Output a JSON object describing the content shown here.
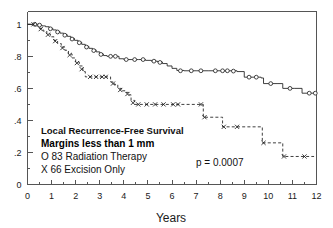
{
  "chart_data": {
    "type": "line",
    "title": "",
    "xlabel": "Years",
    "ylabel": "",
    "xlim": [
      0,
      12
    ],
    "ylim": [
      0,
      1.08
    ],
    "grid": false,
    "legend_position": "inside-lower-left",
    "x_ticks": [
      "0",
      "1",
      "2",
      "3",
      "4",
      "5",
      "6",
      "7",
      "8",
      "9",
      "10",
      "11",
      "12"
    ],
    "y_ticks": [
      "0",
      ".2",
      ".4",
      ".6",
      ".8",
      "1"
    ],
    "y_tick_values": [
      0,
      0.2,
      0.4,
      0.6,
      0.8,
      1.0
    ],
    "x_tick_values": [
      0,
      1,
      2,
      3,
      4,
      5,
      6,
      7,
      8,
      9,
      10,
      11,
      12
    ],
    "annotations": {
      "line1": "Local Recurrence-Free Survival",
      "line2": "Margins less than 1 mm",
      "legend_o": "O  83 Radiation Therapy",
      "legend_x": "X  66 Excision Only",
      "pvalue": "p = 0.0007"
    },
    "series": [
      {
        "name": "Radiation Therapy",
        "n": 83,
        "marker": "o",
        "linestyle": "solid",
        "points": [
          [
            0.0,
            1.0
          ],
          [
            0.25,
            1.0
          ],
          [
            0.45,
            0.995
          ],
          [
            0.6,
            0.99
          ],
          [
            0.75,
            0.985
          ],
          [
            0.9,
            0.975
          ],
          [
            1.05,
            0.965
          ],
          [
            1.2,
            0.955
          ],
          [
            1.35,
            0.945
          ],
          [
            1.5,
            0.935
          ],
          [
            1.65,
            0.925
          ],
          [
            1.8,
            0.912
          ],
          [
            1.95,
            0.9
          ],
          [
            2.1,
            0.888
          ],
          [
            2.25,
            0.875
          ],
          [
            2.4,
            0.862
          ],
          [
            2.55,
            0.85
          ],
          [
            2.7,
            0.84
          ],
          [
            2.85,
            0.828
          ],
          [
            3.0,
            0.815
          ],
          [
            3.15,
            0.805
          ],
          [
            3.3,
            0.8
          ],
          [
            3.55,
            0.8
          ],
          [
            3.8,
            0.785
          ],
          [
            4.0,
            0.78
          ],
          [
            4.3,
            0.78
          ],
          [
            4.6,
            0.78
          ],
          [
            4.9,
            0.775
          ],
          [
            5.15,
            0.77
          ],
          [
            5.4,
            0.765
          ],
          [
            5.6,
            0.755
          ],
          [
            5.8,
            0.74
          ],
          [
            6.0,
            0.725
          ],
          [
            6.2,
            0.712
          ],
          [
            6.5,
            0.71
          ],
          [
            7.0,
            0.71
          ],
          [
            7.5,
            0.71
          ],
          [
            8.0,
            0.71
          ],
          [
            8.4,
            0.71
          ],
          [
            8.7,
            0.705
          ],
          [
            9.0,
            0.67
          ],
          [
            9.4,
            0.67
          ],
          [
            9.7,
            0.665
          ],
          [
            9.8,
            0.63
          ],
          [
            10.4,
            0.63
          ],
          [
            10.6,
            0.6
          ],
          [
            11.1,
            0.6
          ],
          [
            11.4,
            0.57
          ],
          [
            12.0,
            0.57
          ]
        ],
        "censor_marks": [
          [
            0.3,
            1.0
          ],
          [
            0.5,
            0.995
          ],
          [
            0.95,
            0.972
          ],
          [
            1.25,
            0.952
          ],
          [
            1.55,
            0.932
          ],
          [
            1.85,
            0.908
          ],
          [
            2.15,
            0.885
          ],
          [
            2.45,
            0.858
          ],
          [
            2.75,
            0.836
          ],
          [
            3.05,
            0.812
          ],
          [
            3.45,
            0.8
          ],
          [
            3.65,
            0.8
          ],
          [
            4.1,
            0.78
          ],
          [
            4.45,
            0.78
          ],
          [
            4.8,
            0.78
          ],
          [
            5.25,
            0.77
          ],
          [
            5.5,
            0.762
          ],
          [
            6.35,
            0.71
          ],
          [
            6.8,
            0.71
          ],
          [
            7.2,
            0.71
          ],
          [
            7.8,
            0.71
          ],
          [
            8.1,
            0.71
          ],
          [
            8.3,
            0.71
          ],
          [
            8.55,
            0.708
          ],
          [
            9.2,
            0.67
          ],
          [
            9.5,
            0.67
          ],
          [
            10.1,
            0.63
          ],
          [
            10.9,
            0.6
          ],
          [
            11.7,
            0.57
          ],
          [
            11.95,
            0.57
          ]
        ]
      },
      {
        "name": "Excision Only",
        "n": 66,
        "marker": "x",
        "linestyle": "dashed",
        "points": [
          [
            0.0,
            1.0
          ],
          [
            0.2,
            1.0
          ],
          [
            0.35,
            0.99
          ],
          [
            0.5,
            0.975
          ],
          [
            0.65,
            0.958
          ],
          [
            0.8,
            0.94
          ],
          [
            0.95,
            0.922
          ],
          [
            1.1,
            0.9
          ],
          [
            1.25,
            0.88
          ],
          [
            1.4,
            0.858
          ],
          [
            1.55,
            0.838
          ],
          [
            1.7,
            0.815
          ],
          [
            1.85,
            0.79
          ],
          [
            2.0,
            0.765
          ],
          [
            2.15,
            0.74
          ],
          [
            2.3,
            0.705
          ],
          [
            2.4,
            0.672
          ],
          [
            2.7,
            0.672
          ],
          [
            3.0,
            0.672
          ],
          [
            3.3,
            0.672
          ],
          [
            3.45,
            0.64
          ],
          [
            3.6,
            0.625
          ],
          [
            3.75,
            0.6
          ],
          [
            3.9,
            0.585
          ],
          [
            4.05,
            0.575
          ],
          [
            4.2,
            0.56
          ],
          [
            4.3,
            0.525
          ],
          [
            4.45,
            0.5
          ],
          [
            5.0,
            0.5
          ],
          [
            5.5,
            0.5
          ],
          [
            6.0,
            0.5
          ],
          [
            6.3,
            0.5
          ],
          [
            7.25,
            0.5
          ],
          [
            7.3,
            0.42
          ],
          [
            8.05,
            0.42
          ],
          [
            8.1,
            0.36
          ],
          [
            9.7,
            0.36
          ],
          [
            9.75,
            0.26
          ],
          [
            10.55,
            0.26
          ],
          [
            10.6,
            0.175
          ],
          [
            11.9,
            0.175
          ]
        ],
        "censor_marks": [
          [
            0.25,
            1.0
          ],
          [
            0.55,
            0.97
          ],
          [
            0.85,
            0.935
          ],
          [
            1.15,
            0.895
          ],
          [
            1.45,
            0.852
          ],
          [
            1.75,
            0.808
          ],
          [
            2.05,
            0.758
          ],
          [
            2.25,
            0.72
          ],
          [
            2.6,
            0.672
          ],
          [
            2.85,
            0.672
          ],
          [
            3.1,
            0.672
          ],
          [
            3.25,
            0.672
          ],
          [
            3.55,
            0.63
          ],
          [
            3.85,
            0.59
          ],
          [
            4.15,
            0.565
          ],
          [
            4.38,
            0.51
          ],
          [
            4.6,
            0.5
          ],
          [
            4.95,
            0.5
          ],
          [
            5.3,
            0.5
          ],
          [
            5.65,
            0.5
          ],
          [
            6.05,
            0.5
          ],
          [
            6.25,
            0.5
          ],
          [
            7.2,
            0.5
          ],
          [
            7.35,
            0.42
          ],
          [
            8.15,
            0.36
          ],
          [
            8.7,
            0.36
          ],
          [
            9.8,
            0.26
          ],
          [
            10.65,
            0.175
          ],
          [
            11.5,
            0.175
          ]
        ]
      }
    ]
  }
}
